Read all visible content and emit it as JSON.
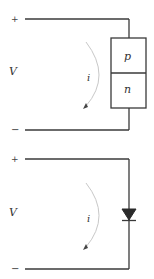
{
  "diagrams": [
    {
      "name": "pn-junction-circuit",
      "terminal_plus": "+",
      "terminal_minus": "−",
      "voltage_label": "V",
      "current_label": "i",
      "component": {
        "type": "pn-junction-block",
        "top_region": "p",
        "bottom_region": "n"
      }
    },
    {
      "name": "diode-symbol-circuit",
      "terminal_plus": "+",
      "terminal_minus": "−",
      "voltage_label": "V",
      "current_label": "i",
      "component": {
        "type": "diode-symbol",
        "orientation": "anode-top, cathode-bottom"
      }
    }
  ],
  "colors": {
    "wire": "#3a3a3a",
    "current_arc": "#c8c8c8",
    "text": "#333333",
    "background": "#ffffff"
  }
}
